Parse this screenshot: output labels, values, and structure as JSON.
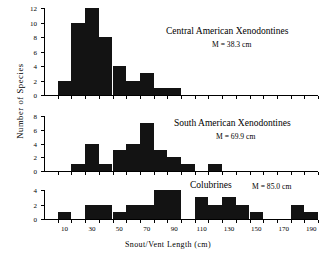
{
  "chart_data": {
    "type": "bar",
    "title": "",
    "xlabel": "Snout/Vent  Length (cm)",
    "ylabel": "Number  of  Species",
    "bin_width": 10,
    "x_range": [
      0,
      200
    ],
    "x_tick_labels": [
      "10",
      "30",
      "50",
      "70",
      "90",
      "110",
      "130",
      "150",
      "170",
      "190"
    ],
    "x_tick_label_values": [
      15,
      35,
      55,
      75,
      95,
      115,
      135,
      155,
      175,
      195
    ],
    "grid": false,
    "legend": "none",
    "panels": [
      {
        "name": "central-american-xenodontines",
        "title": "Central American Xenodontines",
        "subtitle": "M = 38.3 cm",
        "mean_cm": 38.3,
        "ylim": [
          0,
          12
        ],
        "y_ticks": [
          0,
          2,
          4,
          6,
          8,
          10,
          12
        ],
        "bin_starts": [
          10,
          20,
          30,
          40,
          50,
          60,
          70,
          80,
          90
        ],
        "values": [
          2,
          10,
          12,
          8,
          4,
          2,
          3,
          1,
          1
        ]
      },
      {
        "name": "south-american-xenodontines",
        "title": "South American Xenodontines",
        "subtitle": "M = 69.9 cm",
        "mean_cm": 69.9,
        "ylim": [
          0,
          8
        ],
        "y_ticks": [
          0,
          2,
          4,
          6,
          8
        ],
        "bin_starts": [
          20,
          30,
          40,
          50,
          60,
          70,
          80,
          90,
          100,
          120
        ],
        "values": [
          1,
          4,
          1,
          3,
          4,
          7,
          3,
          2,
          1,
          1
        ]
      },
      {
        "name": "colubrines",
        "title": "Colubrines",
        "subtitle": "M = 85.0 cm",
        "mean_cm": 85.0,
        "ylim": [
          0,
          4
        ],
        "y_ticks": [
          0,
          2,
          4
        ],
        "bin_starts": [
          10,
          30,
          40,
          50,
          60,
          70,
          80,
          90,
          110,
          120,
          130,
          140,
          150,
          180,
          190
        ],
        "values": [
          1,
          2,
          2,
          1,
          2,
          2,
          4,
          4,
          3,
          2,
          3,
          2,
          1,
          2,
          1
        ]
      }
    ]
  }
}
